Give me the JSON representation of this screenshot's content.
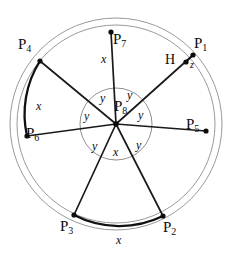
{
  "figure": {
    "canvas": {
      "width": 229,
      "height": 255
    },
    "center": {
      "x": 116,
      "y": 124,
      "label": "P",
      "sub": "8"
    },
    "colors": {
      "stroke_dark": "#101010",
      "stroke_light": "#9a9a9a",
      "background": "#ffffff"
    },
    "circles": [
      {
        "name": "outer-ring",
        "cx": 116,
        "cy": 124,
        "r": 106,
        "style": "thin-gray"
      },
      {
        "name": "main-circle",
        "cx": 116,
        "cy": 124,
        "r": 99,
        "style": "thin-gray"
      },
      {
        "name": "inner-circle",
        "cx": 116,
        "cy": 124,
        "r": 36,
        "style": "thin-gray"
      }
    ]
  },
  "points": [
    {
      "id": "P1",
      "label": "P",
      "sub": "1",
      "x": 193,
      "y": 55,
      "label_x": 194,
      "label_y": 36
    },
    {
      "id": "P2",
      "label": "P",
      "sub": "2",
      "x": 163,
      "y": 216,
      "label_x": 163,
      "label_y": 220
    },
    {
      "id": "P3",
      "label": "P",
      "sub": "3",
      "x": 74,
      "y": 215,
      "label_x": 60,
      "label_y": 219
    },
    {
      "id": "P4",
      "label": "P",
      "sub": "4",
      "x": 40,
      "y": 61,
      "label_x": 18,
      "label_y": 37
    },
    {
      "id": "P5",
      "label": "P",
      "sub": "5",
      "x": 206,
      "y": 131,
      "label_x": 186,
      "label_y": 117
    },
    {
      "id": "P6",
      "label": "P",
      "sub": "6",
      "x": 27,
      "y": 136,
      "label_x": 26,
      "label_y": 126
    },
    {
      "id": "P7",
      "label": "P",
      "sub": "7",
      "x": 111,
      "y": 32,
      "label_x": 113,
      "label_y": 32
    },
    {
      "id": "P8",
      "label": "P",
      "sub": "8",
      "x": 116,
      "y": 124,
      "label_x": 114,
      "label_y": 99
    },
    {
      "id": "H",
      "label": "H",
      "sub": "",
      "x": 186,
      "y": 62,
      "label_x": 165,
      "label_y": 53
    }
  ],
  "radii": [
    {
      "from": "P8",
      "to": "P1"
    },
    {
      "from": "P8",
      "to": "P2"
    },
    {
      "from": "P8",
      "to": "P3"
    },
    {
      "from": "P8",
      "to": "P4"
    },
    {
      "from": "P8",
      "to": "P5"
    },
    {
      "from": "P8",
      "to": "P6"
    },
    {
      "from": "P8",
      "to": "P7"
    }
  ],
  "bold_arcs": [
    {
      "name": "arc-P4-P6",
      "from": "P4",
      "to": "P6",
      "length_label": "x"
    },
    {
      "name": "arc-P3-P2",
      "from": "P3",
      "to": "P2",
      "length_label": "x"
    }
  ],
  "segments": [
    {
      "name": "segment-H-P1",
      "from": "H",
      "to": "P1",
      "length_label": "z"
    }
  ],
  "angle_labels": [
    {
      "name": "angle-P7-P1",
      "text": "y",
      "x": 127,
      "y": 89
    },
    {
      "name": "angle-P1-P5",
      "text": "y",
      "x": 138,
      "y": 109
    },
    {
      "name": "angle-P5-P2",
      "text": "y",
      "x": 136,
      "y": 139
    },
    {
      "name": "angle-P2-P3",
      "text": "x",
      "x": 113,
      "y": 146
    },
    {
      "name": "angle-P3-P6",
      "text": "y",
      "x": 92,
      "y": 140
    },
    {
      "name": "angle-P6-P4",
      "text": "y",
      "x": 84,
      "y": 110
    },
    {
      "name": "angle-P4-P7",
      "text": "y",
      "x": 100,
      "y": 92
    }
  ],
  "side_labels": [
    {
      "name": "side-P7-center",
      "text": "x",
      "x": 101,
      "y": 53
    },
    {
      "name": "side-arc-left",
      "text": "x",
      "x": 36,
      "y": 100
    },
    {
      "name": "side-arc-bottom",
      "text": "x",
      "x": 116,
      "y": 234
    },
    {
      "name": "side-z",
      "text": "z",
      "x": 190,
      "y": 60
    }
  ]
}
